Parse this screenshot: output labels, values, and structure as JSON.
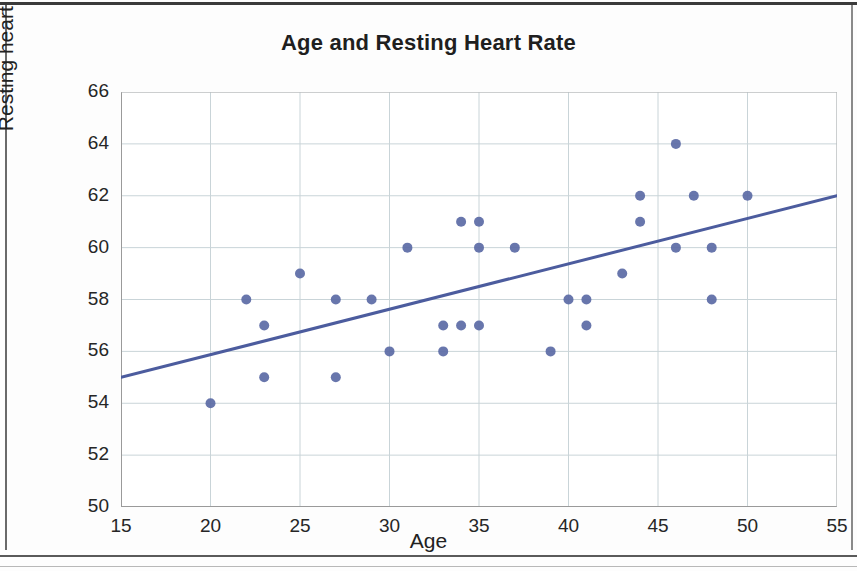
{
  "page": {
    "background_color": "#fdfdfd",
    "frame_color": "#3a3a3a"
  },
  "chart_data": {
    "type": "scatter",
    "title": "Age and Resting Heart Rate",
    "xlabel": "Age",
    "ylabel": "Resting heart rate (BPM)",
    "xlim": [
      15,
      55
    ],
    "ylim": [
      50,
      66
    ],
    "xticks": [
      15,
      20,
      25,
      30,
      35,
      40,
      45,
      50,
      55
    ],
    "yticks": [
      50,
      52,
      54,
      56,
      58,
      60,
      62,
      64,
      66
    ],
    "grid": true,
    "grid_color": "#c9d4d8",
    "legend": null,
    "marker_color": "#5b6aa5",
    "marker_size": 9,
    "points": [
      {
        "x": 20,
        "y": 54
      },
      {
        "x": 22,
        "y": 58
      },
      {
        "x": 23,
        "y": 57
      },
      {
        "x": 23,
        "y": 55
      },
      {
        "x": 25,
        "y": 59
      },
      {
        "x": 27,
        "y": 58
      },
      {
        "x": 27,
        "y": 55
      },
      {
        "x": 29,
        "y": 58
      },
      {
        "x": 30,
        "y": 56
      },
      {
        "x": 31,
        "y": 60
      },
      {
        "x": 33,
        "y": 57
      },
      {
        "x": 33,
        "y": 56
      },
      {
        "x": 34,
        "y": 61
      },
      {
        "x": 34,
        "y": 57
      },
      {
        "x": 35,
        "y": 61
      },
      {
        "x": 35,
        "y": 60
      },
      {
        "x": 35,
        "y": 57
      },
      {
        "x": 37,
        "y": 60
      },
      {
        "x": 39,
        "y": 56
      },
      {
        "x": 40,
        "y": 58
      },
      {
        "x": 41,
        "y": 58
      },
      {
        "x": 41,
        "y": 57
      },
      {
        "x": 43,
        "y": 59
      },
      {
        "x": 44,
        "y": 62
      },
      {
        "x": 44,
        "y": 61
      },
      {
        "x": 46,
        "y": 64
      },
      {
        "x": 46,
        "y": 60
      },
      {
        "x": 47,
        "y": 62
      },
      {
        "x": 48,
        "y": 60
      },
      {
        "x": 48,
        "y": 58
      },
      {
        "x": 50,
        "y": 62
      }
    ],
    "trendline": {
      "color": "#4c5c9e",
      "width": 3,
      "x0": 15,
      "y0": 55,
      "x1": 55,
      "y1": 62
    }
  }
}
